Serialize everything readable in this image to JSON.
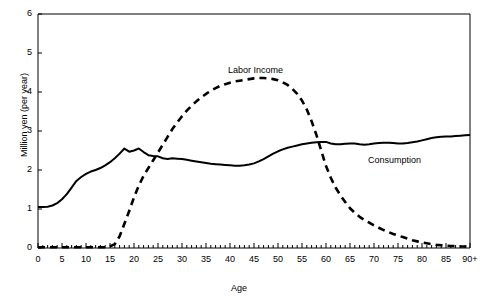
{
  "chart_data": {
    "type": "line",
    "title": "",
    "xlabel": "Age",
    "ylabel": "Million yen (per year)",
    "xlim": [
      0,
      90
    ],
    "ylim": [
      0,
      6
    ],
    "grid": false,
    "legend_position": "inline-annotations",
    "xticks": [
      "0",
      "5",
      "10",
      "15",
      "20",
      "25",
      "30",
      "35",
      "40",
      "45",
      "50",
      "55",
      "60",
      "65",
      "70",
      "75",
      "80",
      "85",
      "90+"
    ],
    "xtick_values": [
      0,
      5,
      10,
      15,
      20,
      25,
      30,
      35,
      40,
      45,
      50,
      55,
      60,
      65,
      70,
      75,
      80,
      85,
      90
    ],
    "yticks": [
      "0",
      "1",
      "2",
      "3",
      "4",
      "5",
      "6"
    ],
    "ytick_values": [
      0,
      1,
      2,
      3,
      4,
      5,
      6
    ],
    "x": [
      0,
      1,
      2,
      3,
      4,
      5,
      6,
      7,
      8,
      9,
      10,
      11,
      12,
      13,
      14,
      15,
      16,
      17,
      18,
      19,
      20,
      21,
      22,
      23,
      24,
      25,
      26,
      27,
      28,
      29,
      30,
      31,
      32,
      33,
      34,
      35,
      36,
      37,
      38,
      39,
      40,
      41,
      42,
      43,
      44,
      45,
      46,
      47,
      48,
      49,
      50,
      51,
      52,
      53,
      54,
      55,
      56,
      57,
      58,
      59,
      60,
      61,
      62,
      63,
      64,
      65,
      66,
      67,
      68,
      69,
      70,
      71,
      72,
      73,
      74,
      75,
      76,
      77,
      78,
      79,
      80,
      81,
      82,
      83,
      84,
      85,
      86,
      87,
      88,
      89,
      90
    ],
    "series": [
      {
        "name": "Consumption",
        "style": "solid",
        "color": "#000000",
        "label_x": 72,
        "label_y": 2.4,
        "values": [
          1.05,
          1.05,
          1.06,
          1.09,
          1.15,
          1.25,
          1.38,
          1.55,
          1.72,
          1.82,
          1.9,
          1.96,
          2.0,
          2.05,
          2.12,
          2.2,
          2.3,
          2.42,
          2.55,
          2.47,
          2.5,
          2.55,
          2.46,
          2.38,
          2.36,
          2.35,
          2.3,
          2.28,
          2.3,
          2.29,
          2.28,
          2.26,
          2.24,
          2.22,
          2.2,
          2.18,
          2.16,
          2.15,
          2.14,
          2.13,
          2.12,
          2.11,
          2.11,
          2.12,
          2.14,
          2.17,
          2.22,
          2.28,
          2.35,
          2.42,
          2.48,
          2.53,
          2.57,
          2.6,
          2.63,
          2.66,
          2.68,
          2.7,
          2.71,
          2.72,
          2.72,
          2.68,
          2.66,
          2.66,
          2.67,
          2.68,
          2.68,
          2.66,
          2.65,
          2.66,
          2.68,
          2.69,
          2.7,
          2.7,
          2.69,
          2.68,
          2.68,
          2.69,
          2.71,
          2.73,
          2.76,
          2.79,
          2.82,
          2.84,
          2.85,
          2.86,
          2.86,
          2.87,
          2.88,
          2.89,
          2.9
        ]
      },
      {
        "name": "Labor Income",
        "style": "dashed",
        "color": "#000000",
        "label_x": 40,
        "label_y": 4.85,
        "values": [
          0.02,
          0.02,
          0.02,
          0.02,
          0.02,
          0.02,
          0.02,
          0.02,
          0.02,
          0.02,
          0.02,
          0.02,
          0.02,
          0.02,
          0.02,
          0.04,
          0.1,
          0.3,
          0.62,
          0.95,
          1.3,
          1.6,
          1.85,
          2.05,
          2.25,
          2.45,
          2.65,
          2.85,
          3.05,
          3.22,
          3.38,
          3.52,
          3.65,
          3.76,
          3.86,
          3.95,
          4.03,
          4.1,
          4.16,
          4.2,
          4.24,
          4.27,
          4.29,
          4.31,
          4.33,
          4.35,
          4.36,
          4.36,
          4.35,
          4.33,
          4.3,
          4.25,
          4.18,
          4.08,
          3.95,
          3.78,
          3.55,
          3.25,
          2.9,
          2.5,
          2.1,
          1.8,
          1.55,
          1.35,
          1.18,
          1.02,
          0.9,
          0.8,
          0.72,
          0.65,
          0.58,
          0.52,
          0.46,
          0.41,
          0.36,
          0.32,
          0.28,
          0.24,
          0.2,
          0.17,
          0.14,
          0.12,
          0.1,
          0.08,
          0.07,
          0.06,
          0.05,
          0.05,
          0.04,
          0.04,
          0.03
        ]
      }
    ]
  },
  "annotations": {
    "labor_income_label": "Labor Income",
    "consumption_label": "Consumption"
  }
}
